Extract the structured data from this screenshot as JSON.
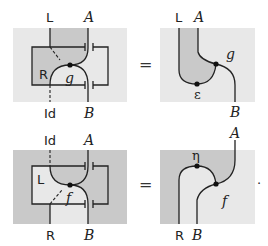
{
  "colors": {
    "light": "#e8e8e8",
    "dark": "#c9c9c9",
    "line": "#222222"
  },
  "top": {
    "left": {
      "top_labels": [
        "L",
        "A"
      ],
      "bottom_labels": [
        "Id",
        "B"
      ],
      "region_label": "R",
      "node_label": "g"
    },
    "equals": "=",
    "right": {
      "top_labels": [
        "L",
        "A"
      ],
      "bottom_label": "B",
      "node_labels": [
        "g",
        "ε"
      ]
    }
  },
  "bottom": {
    "left": {
      "top_labels": [
        "Id",
        "A"
      ],
      "bottom_labels": [
        "R",
        "B"
      ],
      "region_label": "L",
      "node_label": "f"
    },
    "equals": "=",
    "right": {
      "top_label": "A",
      "bottom_labels": [
        "R",
        "B"
      ],
      "node_labels": [
        "η",
        "f"
      ],
      "trailing": "."
    }
  }
}
